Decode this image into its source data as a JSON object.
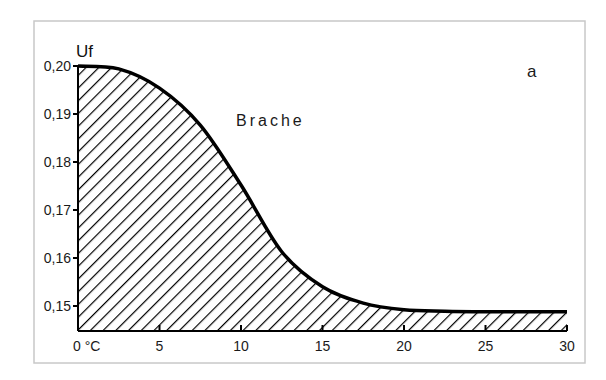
{
  "chart_data": {
    "type": "area",
    "title": "",
    "panel_label": "a",
    "xlabel": "°C",
    "ylabel": "Uf",
    "xlim": [
      0,
      30
    ],
    "ylim": [
      0.145,
      0.2
    ],
    "x_ticks": [
      0,
      5,
      10,
      15,
      20,
      25,
      30
    ],
    "x_tick_labels": [
      "0 °C",
      "5",
      "10",
      "15",
      "20",
      "25",
      "30"
    ],
    "y_ticks": [
      0.15,
      0.16,
      0.17,
      0.18,
      0.19,
      0.2
    ],
    "y_tick_labels": [
      "0,15",
      "0,16",
      "0,17",
      "0,18",
      "0,19",
      "0,20"
    ],
    "grid": false,
    "fill": "hatched",
    "annotations": [
      {
        "text": "Brache",
        "x": 9.8,
        "y": 0.188
      }
    ],
    "series": [
      {
        "name": "Brache",
        "x": [
          0,
          2.5,
          5,
          7.5,
          10,
          12.5,
          15,
          17.5,
          20,
          22.5,
          25,
          27.5,
          30
        ],
        "values": [
          0.2,
          0.1994,
          0.1954,
          0.1877,
          0.1752,
          0.1613,
          0.154,
          0.1506,
          0.1492,
          0.1489,
          0.1488,
          0.1488,
          0.1488
        ]
      }
    ]
  },
  "colors": {
    "line": "#000000",
    "frame": "#c8c8c8",
    "text": "#1a1a1a"
  }
}
